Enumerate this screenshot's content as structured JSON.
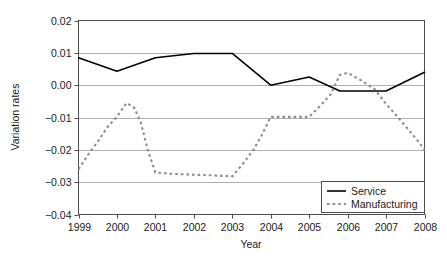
{
  "chart_data": {
    "type": "line",
    "title": "",
    "xlabel": "Year",
    "ylabel": "Variation rates",
    "x": [
      1999,
      2000,
      2001,
      2002,
      2003,
      2004,
      2005,
      2006,
      2007,
      2008
    ],
    "categories": [
      "1999",
      "2000",
      "2001",
      "2002",
      "2003",
      "2004",
      "2005",
      "2006",
      "2007",
      "2008"
    ],
    "xlim": [
      1999,
      2008
    ],
    "ylim": [
      -0.04,
      0.02
    ],
    "yticks": [
      0.02,
      0.01,
      0.0,
      -0.01,
      -0.02,
      -0.03,
      -0.04
    ],
    "ytick_labels": [
      "0.02",
      "0.01",
      "0.00",
      "−0.01",
      "−0.02",
      "−0.03",
      "−0.04"
    ],
    "grid": true,
    "grid_axis": "y",
    "legend_position": "lower-right",
    "series": [
      {
        "name": "Service",
        "style": "solid",
        "color": "#000000",
        "values": [
          0.0085,
          0.0043,
          0.0085,
          0.0098,
          0.0098,
          0.0,
          0.0025,
          -0.0018,
          -0.0018,
          0.004
        ],
        "points": [
          {
            "x": 1999.0,
            "y": 0.0085
          },
          {
            "x": 2000.0,
            "y": 0.0043
          },
          {
            "x": 2001.0,
            "y": 0.0085
          },
          {
            "x": 2002.0,
            "y": 0.0098
          },
          {
            "x": 2003.0,
            "y": 0.0098
          },
          {
            "x": 2004.0,
            "y": 0.0
          },
          {
            "x": 2005.0,
            "y": 0.0025
          },
          {
            "x": 2005.8,
            "y": -0.0018
          },
          {
            "x": 2007.0,
            "y": -0.0018
          },
          {
            "x": 2008.0,
            "y": 0.004
          }
        ]
      },
      {
        "name": "Manufacturing",
        "style": "dotted",
        "color": "#8c8c8c",
        "values": [
          -0.026,
          -0.0098,
          -0.027,
          -0.0277,
          -0.0282,
          -0.0098,
          -0.0098,
          0.0038,
          -0.0005,
          -0.02
        ],
        "points": [
          {
            "x": 1999.0,
            "y": -0.026
          },
          {
            "x": 1999.25,
            "y": -0.0215
          },
          {
            "x": 1999.5,
            "y": -0.0175
          },
          {
            "x": 1999.75,
            "y": -0.013
          },
          {
            "x": 2000.0,
            "y": -0.0098
          },
          {
            "x": 2000.25,
            "y": -0.0055
          },
          {
            "x": 2000.45,
            "y": -0.007
          },
          {
            "x": 2000.62,
            "y": -0.0115
          },
          {
            "x": 2000.8,
            "y": -0.02
          },
          {
            "x": 2001.0,
            "y": -0.027
          },
          {
            "x": 2001.4,
            "y": -0.0274
          },
          {
            "x": 2002.0,
            "y": -0.0277
          },
          {
            "x": 2002.5,
            "y": -0.0279
          },
          {
            "x": 2003.0,
            "y": -0.0282
          },
          {
            "x": 2003.3,
            "y": -0.024
          },
          {
            "x": 2003.55,
            "y": -0.02
          },
          {
            "x": 2003.75,
            "y": -0.0158
          },
          {
            "x": 2004.0,
            "y": -0.0098
          },
          {
            "x": 2004.5,
            "y": -0.0098
          },
          {
            "x": 2005.0,
            "y": -0.0098
          },
          {
            "x": 2005.3,
            "y": -0.0062
          },
          {
            "x": 2005.55,
            "y": -0.003
          },
          {
            "x": 2005.8,
            "y": 0.0032
          },
          {
            "x": 2006.0,
            "y": 0.0038
          },
          {
            "x": 2006.35,
            "y": 0.0015
          },
          {
            "x": 2006.7,
            "y": -0.0012
          },
          {
            "x": 2007.0,
            "y": -0.0058
          },
          {
            "x": 2007.3,
            "y": -0.0098
          },
          {
            "x": 2007.6,
            "y": -0.014
          },
          {
            "x": 2007.85,
            "y": -0.0175
          },
          {
            "x": 2008.0,
            "y": -0.02
          }
        ]
      }
    ]
  },
  "axes": {
    "y_title": "Variation rates",
    "x_title": "Year",
    "y_labels": [
      "0.02",
      "0.01",
      "0.00",
      "−0.01",
      "−0.02",
      "−0.03",
      "−0.04"
    ],
    "x_labels": [
      "1999",
      "2000",
      "2001",
      "2002",
      "2003",
      "2004",
      "2005",
      "2006",
      "2007",
      "2008"
    ]
  },
  "legend": {
    "entries": [
      {
        "label": "Service",
        "style": "solid",
        "color": "#000000"
      },
      {
        "label": "Manufacturing",
        "style": "dotted",
        "color": "#8c8c8c"
      }
    ]
  },
  "colors": {
    "service": "#000000",
    "manufacturing": "#8c8c8c",
    "grid": "#b0b0b0",
    "frame": "#4d4d4d",
    "text": "#1a1a1a",
    "background": "#ffffff"
  }
}
